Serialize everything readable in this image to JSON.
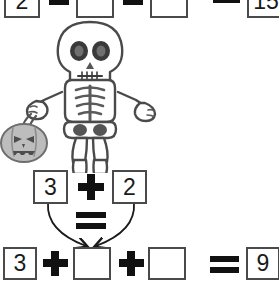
{
  "worksheet": {
    "type": "halloween-math-worksheet",
    "theme": "skeleton-jack-o-lantern",
    "ink_color": "#4a4a4a",
    "text_color": "#1a1a1a"
  },
  "equations": {
    "top": {
      "name": "top-equation",
      "clipped": true,
      "terms": [
        {
          "value": "2",
          "blank": false
        },
        {
          "value": "",
          "blank": true
        },
        {
          "value": "",
          "blank": true
        }
      ],
      "operators": [
        "+",
        "+"
      ],
      "equals": "=",
      "result": "15"
    },
    "middle": {
      "name": "middle-equation",
      "terms": [
        {
          "value": "3",
          "blank": false
        },
        {
          "value": "2",
          "blank": false
        }
      ],
      "operators": [
        "+"
      ],
      "equals": "="
    },
    "bottom": {
      "name": "bottom-equation",
      "terms": [
        {
          "value": "3",
          "blank": false
        },
        {
          "value": "",
          "blank": true
        },
        {
          "value": "",
          "blank": true
        }
      ],
      "operators": [
        "+",
        "+"
      ],
      "equals": "=",
      "result": "9"
    }
  },
  "arrows": {
    "left": "curved-arrow-down-right",
    "right": "curved-arrow-down-left",
    "target": "bottom-equation-second-term"
  },
  "figure": {
    "name": "skeleton",
    "holding": "jack-o-lantern-bucket",
    "skull": {
      "eyes": 2,
      "nose": "triangle",
      "mouth": "stitched-teeth"
    },
    "bucket": {
      "name": "jack-o-lantern-bucket",
      "color": "#b8b8b8",
      "eyes": "triangles",
      "mouth": "toothy-grin"
    }
  }
}
